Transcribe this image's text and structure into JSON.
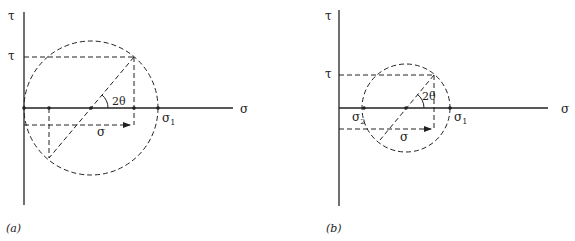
{
  "figures": [
    {
      "id": "a",
      "caption": "(a)",
      "axis_labels": {
        "vertical": "τ",
        "horizontal": "σ"
      },
      "tau_label": "τ",
      "sigma_label": "σ",
      "sigma1_label": "σ",
      "sigma1_sub": "1",
      "angle_label": "2θ"
    },
    {
      "id": "b",
      "caption": "(b)",
      "axis_labels": {
        "vertical": "τ",
        "horizontal": "σ"
      },
      "tau_label": "τ",
      "sigma_label": "σ",
      "sigma1_label": "σ",
      "sigma1_sub": "1",
      "sigma2_label": "σ",
      "sigma2_sub": "2",
      "angle_label": "2θ"
    }
  ],
  "colors": {
    "ink": "#222222",
    "background": "#ffffff"
  }
}
